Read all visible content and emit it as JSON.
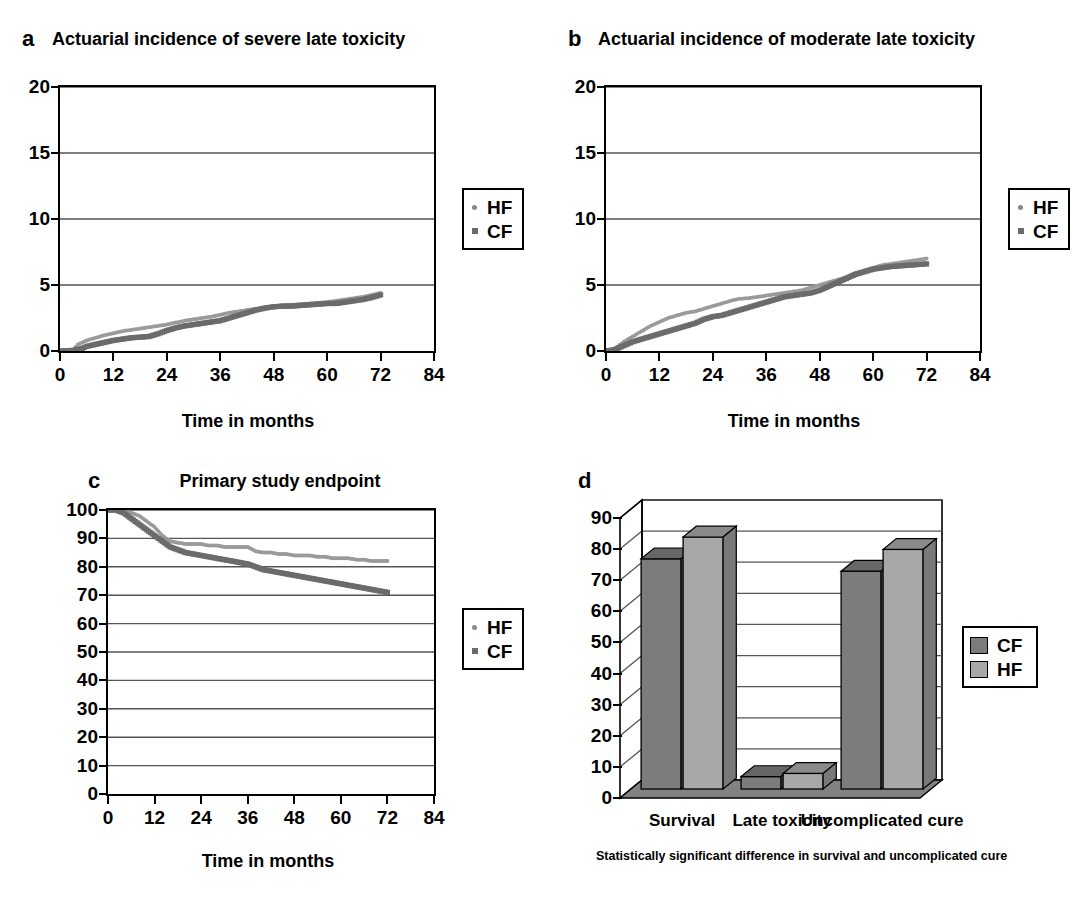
{
  "figure": {
    "panels": [
      {
        "letter": "a",
        "title": "Actuarial incidence of severe late toxicity",
        "xlabel": "Time in months",
        "legend": [
          {
            "label": "HF",
            "marker": "dot"
          },
          {
            "label": "CF",
            "marker": "square"
          }
        ]
      },
      {
        "letter": "b",
        "title": "Actuarial incidence of moderate late toxicity",
        "xlabel": "Time in months",
        "legend": [
          {
            "label": "HF",
            "marker": "dot"
          },
          {
            "label": "CF",
            "marker": "square"
          }
        ]
      },
      {
        "letter": "c",
        "title": "Primary study endpoint",
        "xlabel": "Time in months",
        "legend": [
          {
            "label": "HF",
            "marker": "dot"
          },
          {
            "label": "CF",
            "marker": "square"
          }
        ]
      },
      {
        "letter": "d",
        "title": "",
        "footnote": "Statistically significant difference in survival and uncomplicated cure",
        "legend": [
          {
            "label": "CF",
            "marker": "box-dark"
          },
          {
            "label": "HF",
            "marker": "box-light"
          }
        ]
      }
    ]
  },
  "colors": {
    "hf_line": "#9a9a9a",
    "cf_line": "#6b6b6b",
    "bar_cf": "#7c7c7c",
    "bar_hf": "#a8a8a8",
    "bar_top": "#8f8f8f",
    "axis": "#000000",
    "grid": "#555555"
  },
  "chart_data": [
    {
      "id": "a",
      "type": "line",
      "title": "Actuarial incidence of severe late toxicity",
      "xlabel": "Time in months",
      "ylabel": "",
      "xlim": [
        0,
        84
      ],
      "ylim": [
        0,
        20
      ],
      "xticks": [
        0,
        12,
        24,
        36,
        48,
        60,
        72,
        84
      ],
      "yticks": [
        0,
        5,
        10,
        15,
        20
      ],
      "grid": true,
      "legend_position": "right",
      "series": [
        {
          "name": "HF",
          "marker": "dot",
          "x": [
            0,
            3,
            4,
            6,
            8,
            10,
            12,
            14,
            16,
            18,
            20,
            22,
            24,
            26,
            28,
            30,
            32,
            34,
            36,
            38,
            40,
            42,
            44,
            46,
            48,
            50,
            52,
            54,
            56,
            58,
            60,
            62,
            64,
            66,
            68,
            70,
            72
          ],
          "y": [
            0,
            0.1,
            0.5,
            0.8,
            1.0,
            1.2,
            1.35,
            1.5,
            1.6,
            1.7,
            1.8,
            1.9,
            2.0,
            2.15,
            2.3,
            2.4,
            2.5,
            2.6,
            2.75,
            2.9,
            3.0,
            3.1,
            3.2,
            3.3,
            3.4,
            3.45,
            3.5,
            3.55,
            3.6,
            3.65,
            3.7,
            3.8,
            3.9,
            4.0,
            4.1,
            4.25,
            4.4
          ]
        },
        {
          "name": "CF",
          "marker": "square",
          "x": [
            0,
            3,
            5,
            6,
            8,
            10,
            12,
            14,
            16,
            18,
            20,
            22,
            24,
            26,
            28,
            30,
            32,
            34,
            36,
            38,
            40,
            42,
            44,
            46,
            48,
            50,
            52,
            54,
            56,
            58,
            60,
            62,
            64,
            66,
            68,
            70,
            72
          ],
          "y": [
            0,
            0.05,
            0.2,
            0.35,
            0.5,
            0.65,
            0.8,
            0.9,
            1.0,
            1.05,
            1.1,
            1.3,
            1.55,
            1.75,
            1.9,
            2.0,
            2.1,
            2.2,
            2.3,
            2.5,
            2.7,
            2.9,
            3.1,
            3.25,
            3.35,
            3.4,
            3.4,
            3.45,
            3.5,
            3.55,
            3.6,
            3.6,
            3.7,
            3.8,
            3.9,
            4.05,
            4.25
          ]
        }
      ]
    },
    {
      "id": "b",
      "type": "line",
      "title": "Actuarial incidence of moderate late toxicity",
      "xlabel": "Time in months",
      "ylabel": "",
      "xlim": [
        0,
        84
      ],
      "ylim": [
        0,
        20
      ],
      "xticks": [
        0,
        12,
        24,
        36,
        48,
        60,
        72,
        84
      ],
      "yticks": [
        0,
        5,
        10,
        15,
        20
      ],
      "grid": true,
      "legend_position": "right",
      "series": [
        {
          "name": "HF",
          "marker": "dot",
          "x": [
            0,
            2,
            4,
            6,
            8,
            10,
            12,
            14,
            16,
            18,
            20,
            22,
            24,
            26,
            28,
            30,
            32,
            34,
            36,
            38,
            40,
            42,
            44,
            46,
            48,
            50,
            52,
            54,
            56,
            58,
            60,
            62,
            64,
            66,
            68,
            70,
            72
          ],
          "y": [
            0,
            0.2,
            0.7,
            1.1,
            1.5,
            1.9,
            2.2,
            2.5,
            2.7,
            2.9,
            3.0,
            3.2,
            3.4,
            3.6,
            3.8,
            3.95,
            4.0,
            4.1,
            4.2,
            4.3,
            4.4,
            4.5,
            4.6,
            4.8,
            5.0,
            5.2,
            5.4,
            5.6,
            5.9,
            6.1,
            6.3,
            6.5,
            6.6,
            6.7,
            6.8,
            6.9,
            7.0
          ]
        },
        {
          "name": "CF",
          "marker": "square",
          "x": [
            0,
            2,
            4,
            6,
            8,
            10,
            12,
            14,
            16,
            18,
            20,
            22,
            24,
            26,
            28,
            30,
            32,
            34,
            36,
            38,
            40,
            42,
            44,
            46,
            48,
            50,
            52,
            54,
            56,
            58,
            60,
            62,
            64,
            66,
            68,
            70,
            72
          ],
          "y": [
            0,
            0.1,
            0.4,
            0.7,
            0.9,
            1.1,
            1.3,
            1.5,
            1.7,
            1.9,
            2.1,
            2.4,
            2.6,
            2.7,
            2.9,
            3.1,
            3.3,
            3.5,
            3.7,
            3.9,
            4.1,
            4.2,
            4.3,
            4.4,
            4.6,
            4.9,
            5.2,
            5.5,
            5.8,
            6.0,
            6.2,
            6.3,
            6.4,
            6.45,
            6.5,
            6.55,
            6.6
          ]
        }
      ]
    },
    {
      "id": "c",
      "type": "line",
      "title": "Primary study endpoint",
      "xlabel": "Time in months",
      "ylabel": "",
      "xlim": [
        0,
        84
      ],
      "ylim": [
        0,
        100
      ],
      "xticks": [
        0,
        12,
        24,
        36,
        48,
        60,
        72,
        84
      ],
      "yticks": [
        0,
        10,
        20,
        30,
        40,
        50,
        60,
        70,
        80,
        90,
        100
      ],
      "grid": true,
      "legend_position": "right",
      "series": [
        {
          "name": "HF",
          "marker": "dot",
          "x": [
            0,
            2,
            4,
            6,
            8,
            10,
            12,
            14,
            16,
            18,
            20,
            22,
            24,
            26,
            28,
            30,
            32,
            34,
            36,
            38,
            40,
            42,
            44,
            46,
            48,
            50,
            52,
            54,
            56,
            58,
            60,
            62,
            64,
            66,
            68,
            70,
            72
          ],
          "y": [
            100,
            100,
            99.5,
            99,
            98,
            96,
            94,
            91,
            89,
            88.5,
            88,
            88,
            88,
            87.5,
            87.5,
            87,
            87,
            87,
            87,
            85.5,
            85,
            85,
            84.5,
            84.5,
            84,
            84,
            84,
            83.5,
            83.5,
            83,
            83,
            83,
            82.5,
            82.5,
            82,
            82,
            82
          ]
        },
        {
          "name": "CF",
          "marker": "square",
          "x": [
            0,
            2,
            4,
            6,
            8,
            10,
            12,
            14,
            16,
            18,
            20,
            22,
            24,
            26,
            28,
            30,
            32,
            34,
            36,
            38,
            40,
            42,
            44,
            46,
            48,
            50,
            52,
            54,
            56,
            58,
            60,
            62,
            64,
            66,
            68,
            70,
            72
          ],
          "y": [
            100,
            100,
            99,
            97,
            95,
            93,
            91,
            89,
            87,
            86,
            85,
            84.5,
            84,
            83.5,
            83,
            82.5,
            82,
            81.5,
            81,
            80,
            79,
            78.5,
            78,
            77.5,
            77,
            76.5,
            76,
            75.5,
            75,
            74.5,
            74,
            73.5,
            73,
            72.5,
            72,
            71.5,
            71
          ]
        }
      ]
    },
    {
      "id": "d",
      "type": "bar",
      "title": "",
      "footnote": "Statistically significant difference in survival and uncomplicated cure",
      "categories": [
        "Survival",
        "Late toxicity",
        "Uncomplicated cure"
      ],
      "xlabel": "",
      "ylabel": "",
      "ylim": [
        0,
        90
      ],
      "yticks": [
        0,
        10,
        20,
        30,
        40,
        50,
        60,
        70,
        80,
        90
      ],
      "grid": true,
      "legend_position": "right",
      "series": [
        {
          "name": "CF",
          "values": [
            74,
            4,
            70
          ]
        },
        {
          "name": "HF",
          "values": [
            81,
            5,
            77
          ]
        }
      ]
    }
  ]
}
